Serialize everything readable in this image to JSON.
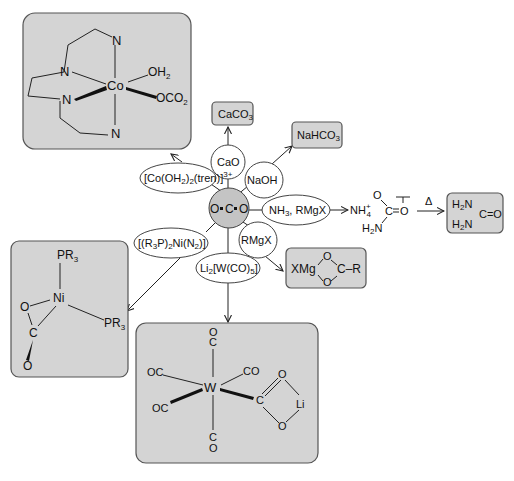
{
  "diagram": {
    "center": {
      "label": "O=C=O",
      "atoms": [
        "O",
        "C",
        "O"
      ]
    },
    "reagents": [
      {
        "id": "cao",
        "label": "CaO",
        "product": "CaCO3"
      },
      {
        "id": "naoh",
        "label": "NaOH",
        "product": "NaHCO3"
      },
      {
        "id": "nh3",
        "label": "NH3, RMgX",
        "product": "NH4+ carbamate"
      },
      {
        "id": "rmgx",
        "label": "RMgX",
        "product": "XMg carboxylate"
      },
      {
        "id": "li2w",
        "label": "Li2[W(CO)5]",
        "product": "W carbonyl CO2 complex"
      },
      {
        "id": "ni",
        "label": "[(R3P)2Ni(N2)]",
        "product": "Ni CO2 complex"
      },
      {
        "id": "co",
        "label": "[Co(OH2)2(tren)]3+",
        "product": "Co tren complex"
      }
    ],
    "labels": {
      "cao": "CaO",
      "naoh": "NaOH",
      "nh3_main": "NH",
      "nh3_sub": "3",
      "nh3_rest": ", RMgX",
      "rmgx": "RMgX",
      "li2w_a": "Li",
      "li2w_sub1": "2",
      "li2w_b": "[W(CO)",
      "li2w_sub2": "5",
      "li2w_c": "]",
      "ni_a": "[(R",
      "ni_sub1": "3",
      "ni_b": "P)",
      "ni_sub2": "2",
      "ni_c": "Ni(N",
      "ni_sub3": "2",
      "ni_d": ")]",
      "co_a": "[Co(OH",
      "co_sub1": "2",
      "co_b": ")",
      "co_sub2": "2",
      "co_c": "(tren)]",
      "co_sup": "3+"
    },
    "products": {
      "caco3_main": "CaCO",
      "caco3_sub": "3",
      "nahco3_main": "NaHCO",
      "nahco3_sub": "3",
      "carbamate": {
        "nh4": "NH",
        "nh4_sub": "4",
        "nh4_sup": "+",
        "o_top": "O",
        "c": "C",
        "o_right": "O",
        "h2n": "H",
        "h2n_sub": "2",
        "n": "N"
      },
      "heat_symbol": "Δ",
      "urea": {
        "h2n_top": "H",
        "sub_top": "2",
        "n_top": "N",
        "h2n_bot": "H",
        "sub_bot": "2",
        "n_bot": "N",
        "co": "C=O"
      },
      "grignard": {
        "xmg": "XMg",
        "o_top": "O",
        "o_bot": "O",
        "c_r": "C–R"
      },
      "cobalt": {
        "co": "Co",
        "n": "N",
        "oh2": "OH",
        "oh2_sub": "2",
        "oco2": "OCO",
        "oco2_sub": "2"
      },
      "nickel": {
        "ni": "Ni",
        "pr3": "PR",
        "pr3_sub": "3",
        "o": "O",
        "c": "C"
      },
      "tungsten": {
        "w": "W",
        "oc": "OC",
        "co": "CO",
        "o": "O",
        "c": "C",
        "li": "Li"
      }
    },
    "colors": {
      "box_fill": "#d4d4d4",
      "center_fill": "#c4c4c4",
      "line": "#222222"
    }
  }
}
